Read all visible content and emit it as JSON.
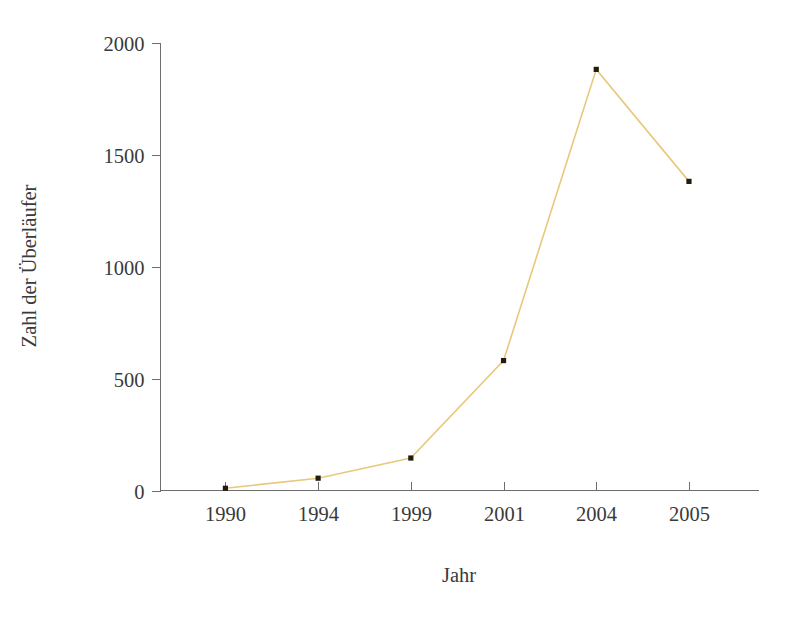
{
  "chart_data": {
    "type": "line",
    "title": "",
    "xlabel": "Jahr",
    "ylabel": "Zahl der Überläufer",
    "categories": [
      "1990",
      "1994",
      "1999",
      "2001",
      "2004",
      "2005"
    ],
    "values": [
      10,
      55,
      145,
      580,
      1880,
      1380
    ],
    "series": [
      {
        "name": "Zahl der Überläufer",
        "values": [
          10,
          55,
          145,
          580,
          1880,
          1380
        ]
      }
    ],
    "ylim": [
      0,
      2000
    ],
    "yticks": [
      "0",
      "500",
      "1000",
      "1500",
      "2000"
    ],
    "ytick_values": [
      0,
      500,
      1000,
      1500,
      2000
    ],
    "xticks": [
      "1990",
      "1994",
      "1999",
      "2001",
      "2004",
      "2005"
    ],
    "grid": false,
    "legend": "none",
    "line_color": "#e8c87a",
    "marker_color": "#231a10",
    "axis_color": "#6e6e6e",
    "background_color": "#ffffff"
  },
  "axes": {
    "y_title": "Zahl der Überläufer",
    "x_title": "Jahr",
    "y_tick_labels": [
      "2000",
      "1500",
      "1000",
      "500",
      "0"
    ],
    "x_tick_labels": [
      "1990",
      "1994",
      "1999",
      "2001",
      "2004",
      "2005"
    ]
  }
}
